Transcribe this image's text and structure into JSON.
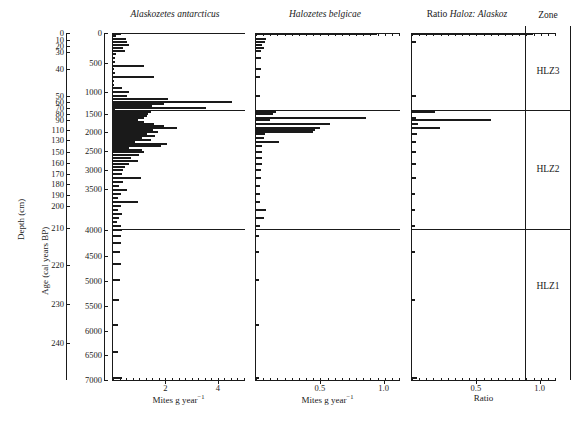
{
  "figure": {
    "type": "stratigraphic-bar-diagram",
    "depth_axis_label": "Depth (cm)",
    "age_axis_label": "Age (cal years BP)",
    "zone_header": "Zone"
  },
  "axes": {
    "depth": {
      "label": "Depth (cm)",
      "unit": "cm",
      "ticks": [
        0,
        10,
        20,
        30,
        40,
        50,
        60,
        70,
        80,
        90,
        110,
        130,
        150,
        160,
        170,
        180,
        190,
        200,
        210,
        220,
        230,
        240
      ],
      "tick_y": [
        33,
        40,
        46,
        52,
        69,
        96,
        102,
        108,
        114,
        120,
        130,
        140,
        152,
        163,
        174,
        184,
        195,
        206,
        228,
        265,
        304,
        343
      ]
    },
    "age": {
      "label": "Age (cal years BP)",
      "ticks": [
        0,
        500,
        1000,
        1500,
        2000,
        2500,
        3000,
        3500,
        4000,
        4500,
        5000,
        5500,
        6000,
        6500,
        7000
      ],
      "tick_y": [
        33,
        63,
        92,
        114,
        132,
        151,
        170,
        189,
        230,
        256,
        281,
        306,
        331,
        355,
        380
      ]
    }
  },
  "panels": [
    {
      "name": "alaskozetes",
      "title_italic": "Alaskozetes antarcticus",
      "xlabel": "Mites g year",
      "xlabel_sup": "−1",
      "xmax": 5.0,
      "xticks": [
        2,
        4
      ],
      "xticklabels": [
        "2",
        "4"
      ]
    },
    {
      "name": "halozetes",
      "title_italic": "Halozetes belgicae",
      "xlabel": "Mites g year",
      "xlabel_sup": "−1",
      "xmax": 1.12,
      "xticks": [
        0.5,
        1.0
      ],
      "xticklabels": [
        "0.5",
        "1.0"
      ]
    },
    {
      "name": "ratio",
      "title_plain": "Ratio ",
      "title_italic": "Haloz: Alaskoz",
      "xlabel": "Ratio",
      "xmax": 1.12,
      "xticks": [
        0.5,
        1.0
      ],
      "xticklabels": [
        "0.5",
        "1.0"
      ]
    }
  ],
  "zones": [
    {
      "label": "HLZ3",
      "y_top": 33,
      "y_bottom": 110,
      "center_y": 72
    },
    {
      "label": "HLZ2",
      "y_top": 110,
      "y_bottom": 229,
      "center_y": 170
    },
    {
      "label": "HLZ1",
      "y_top": 229,
      "y_bottom": 380,
      "center_y": 287
    }
  ],
  "zone_boundaries_y": [
    110,
    229
  ],
  "chart_data": {
    "type": "bar",
    "orientation": "horizontal",
    "ylabel": "Depth (cm) / Age (cal years BP)",
    "ylim_depth": [
      0,
      245
    ],
    "ylim_age": [
      0,
      7000
    ],
    "grid": false,
    "legend": "none",
    "series": [
      {
        "name": "Alaskozetes antarcticus",
        "xlabel": "Mites g year-1",
        "xlim": [
          0,
          5.0
        ],
        "samples_y": [
          34,
          36,
          39,
          42,
          45,
          48,
          51,
          54,
          58,
          62,
          66,
          69,
          73,
          77,
          81,
          85,
          88,
          92,
          96,
          99,
          102,
          104,
          106,
          108,
          110,
          112,
          114,
          116,
          118,
          120,
          122,
          124,
          126,
          128,
          130,
          132,
          134,
          136,
          138,
          140,
          142,
          144,
          146,
          148,
          150,
          152,
          155,
          158,
          161,
          164,
          167,
          170,
          174,
          178,
          182,
          186,
          190,
          194,
          198,
          202,
          206,
          210,
          214,
          218,
          222,
          226,
          230,
          236,
          243,
          252,
          264,
          280,
          300,
          325,
          352,
          378
        ],
        "values": [
          0.3,
          0.12,
          0.5,
          0.55,
          0.62,
          0.4,
          0.45,
          0.1,
          0.08,
          0.06,
          1.2,
          0.05,
          0.06,
          1.55,
          0.04,
          0.05,
          0.35,
          0.6,
          0.55,
          2.1,
          4.55,
          1.95,
          1.5,
          3.55,
          0.06,
          1.45,
          1.35,
          1.28,
          1.18,
          0.95,
          1.2,
          1.55,
          1.95,
          2.45,
          1.52,
          1.72,
          1.3,
          1.62,
          1.1,
          1.45,
          0.85,
          2.05,
          1.85,
          0.6,
          1.1,
          1.18,
          1.0,
          0.7,
          0.95,
          0.6,
          0.45,
          0.4,
          0.35,
          1.05,
          0.38,
          0.22,
          0.52,
          0.3,
          0.2,
          0.95,
          0.3,
          0.18,
          0.35,
          0.22,
          0.15,
          0.3,
          0.35,
          0.3,
          0.32,
          0.28,
          0.3,
          0.25,
          0.22,
          0.2,
          0.18,
          0.35
        ]
      },
      {
        "name": "Halozetes belgicae",
        "xlabel": "Mites g year-1",
        "xlim": [
          0,
          1.12
        ],
        "samples_y": [
          34,
          39,
          42,
          45,
          48,
          51,
          58,
          69,
          77,
          96,
          112,
          114,
          118,
          120,
          124,
          128,
          130,
          132,
          134,
          138,
          142,
          146,
          152,
          158,
          164,
          170,
          178,
          186,
          194,
          202,
          210,
          218,
          226,
          236,
          252,
          280,
          325,
          378
        ],
        "values": [
          0.95,
          0.08,
          0.07,
          0.05,
          0.06,
          0.04,
          0.04,
          0.04,
          0.03,
          0.03,
          0.16,
          0.13,
          0.86,
          0.11,
          0.58,
          0.5,
          0.46,
          0.45,
          0.07,
          0.06,
          0.18,
          0.05,
          0.05,
          0.05,
          0.05,
          0.04,
          0.04,
          0.03,
          0.03,
          0.03,
          0.08,
          0.06,
          0.03,
          0.02,
          0.02,
          0.02,
          0.02,
          0.02
        ]
      },
      {
        "name": "Ratio Haloz: Alaskoz",
        "xlabel": "Ratio",
        "xlim": [
          0,
          1.12
        ],
        "samples_y": [
          34,
          42,
          96,
          112,
          118,
          120,
          124,
          128,
          134,
          142,
          152,
          164,
          178,
          194,
          210,
          226,
          252,
          300,
          378
        ],
        "values": [
          0.95,
          0.03,
          0.03,
          0.18,
          0.03,
          0.62,
          0.05,
          0.22,
          0.04,
          0.03,
          0.03,
          0.03,
          0.03,
          0.02,
          0.02,
          0.02,
          0.02,
          0.02,
          0.04
        ]
      }
    ]
  }
}
